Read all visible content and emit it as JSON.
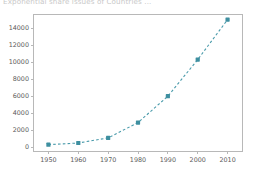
{
  "clipped_header": {
    "text": "Exponential share issues of Countries ..."
  },
  "chart_data": {
    "type": "line",
    "title": "",
    "subtitle": "",
    "xlabel": "",
    "ylabel": "",
    "x": [
      1950,
      1960,
      1970,
      1980,
      1990,
      2000,
      2010
    ],
    "categories": [
      "1950",
      "1960",
      "1970",
      "1980",
      "1990",
      "2000",
      "2010"
    ],
    "values": [
      300,
      500,
      1100,
      2900,
      6000,
      10300,
      15000
    ],
    "series": [
      {
        "name": "",
        "values": [
          300,
          500,
          1100,
          2900,
          6000,
          10300,
          15000
        ],
        "color": "#3e8fa0",
        "linestyle": "dashed",
        "marker": "square"
      }
    ],
    "xlim": [
      1945,
      2015
    ],
    "ylim": [
      -500,
      15600
    ],
    "xticks": [
      1950,
      1960,
      1970,
      1980,
      1990,
      2000,
      2010
    ],
    "xticklabels": [
      "1950",
      "1960",
      "1970",
      "1980",
      "1990",
      "2000",
      "2010"
    ],
    "yticks": [
      0,
      2000,
      4000,
      6000,
      8000,
      10000,
      12000,
      14000
    ],
    "yticklabels": [
      "0",
      "2000",
      "4000",
      "6000",
      "8000",
      "10000",
      "12000",
      "14000"
    ],
    "grid": false,
    "legend": null,
    "legend_position": "none",
    "annotations": []
  },
  "colors": {
    "series": "#3e8fa0",
    "line": "#4a9bab",
    "axis": "#b8b8b8",
    "tick_text": "#5b5b5b",
    "background": "#ffffff"
  }
}
